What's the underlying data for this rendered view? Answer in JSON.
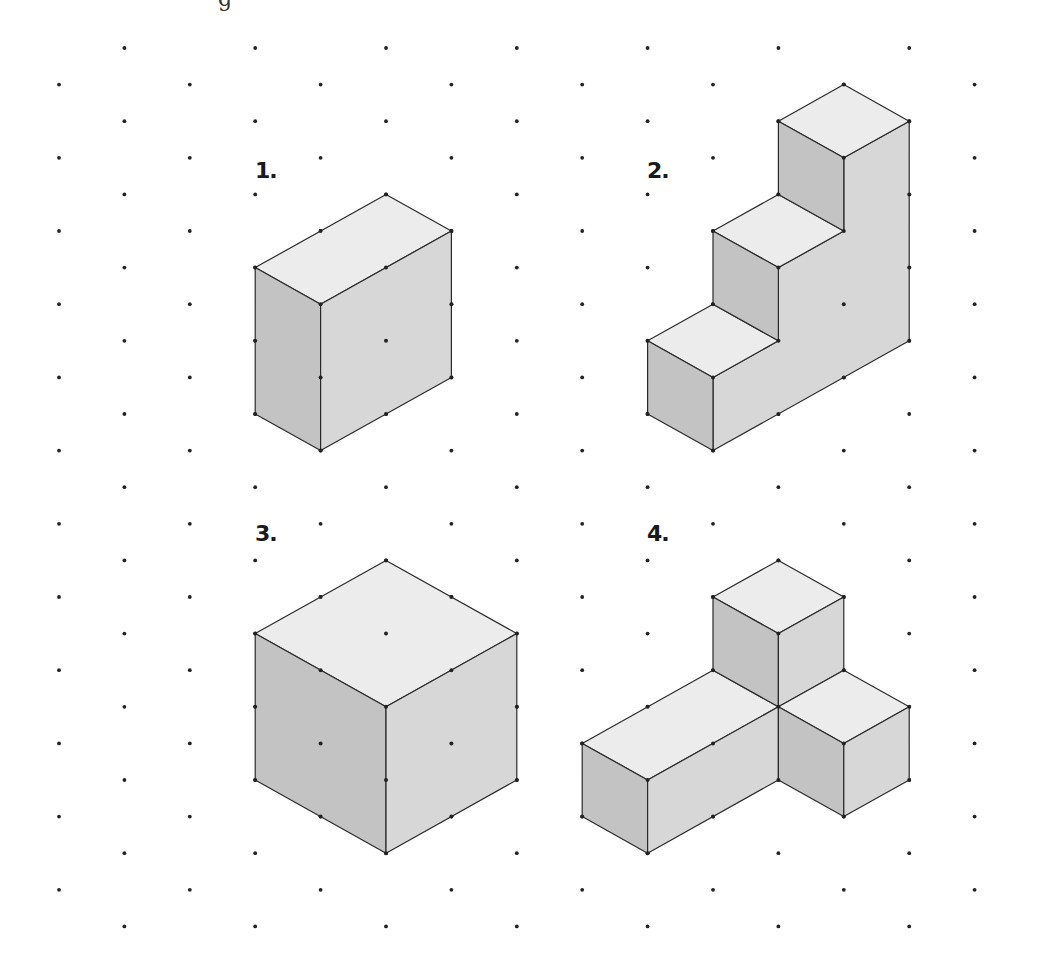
{
  "page": {
    "cutoff_text": "g"
  },
  "figures": [
    {
      "id": "1",
      "label": "1.",
      "description": "rectangular box 2 by 1 by 2 units"
    },
    {
      "id": "2",
      "label": "2.",
      "description": "three-step staircase"
    },
    {
      "id": "3",
      "label": "3.",
      "description": "cube 2 by 2 by 2 units"
    },
    {
      "id": "4",
      "label": "4.",
      "description": "L-shaped arrangement of unit cubes with raised cube"
    }
  ],
  "colors": {
    "top_face": "#ececec",
    "left_face": "#c3c3c3",
    "right_face": "#d7d7d7",
    "edge": "#2a2a2a",
    "grid_dot": "#222222"
  }
}
